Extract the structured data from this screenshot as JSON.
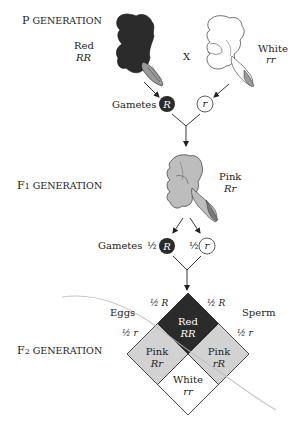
{
  "generations": {
    "p": {
      "letter": "P",
      "rest": " GENERATION"
    },
    "f1": {
      "letter": "F",
      "sub": "1",
      "rest": " GENERATION"
    },
    "f2": {
      "letter": "F",
      "sub": "2",
      "rest": " GENERATION"
    }
  },
  "parents": {
    "red": {
      "phenotype": "Red",
      "genotype": "RR"
    },
    "white": {
      "phenotype": "White",
      "genotype": "rr"
    },
    "cross_symbol": "X"
  },
  "p_gametes": {
    "label": "Gametes",
    "dominant": "R",
    "recessive": "r"
  },
  "f1": {
    "phenotype": "Pink",
    "genotype": "Rr"
  },
  "f1_gametes": {
    "label": "Gametes",
    "dominant_fraction": "½",
    "dominant": "R",
    "recessive_fraction": "½",
    "recessive": "r"
  },
  "punnett": {
    "eggs_label": "Eggs",
    "sperm_label": "Sperm",
    "egg_R": "½ R",
    "egg_r": "½ r",
    "sperm_R": "½ R",
    "sperm_r": "½ r",
    "cells": {
      "top": {
        "phenotype": "Red",
        "genotype": "RR"
      },
      "left": {
        "phenotype": "Pink",
        "genotype": "Rr"
      },
      "right": {
        "phenotype": "Pink",
        "genotype": "rR"
      },
      "bottom": {
        "phenotype": "White",
        "genotype": "rr"
      }
    }
  },
  "colors": {
    "red_dark": "#2b2b2b",
    "pink_gray": "#d2d2d2",
    "white": "#ffffff",
    "line": "#333333",
    "curve": "#c8c8c8"
  }
}
